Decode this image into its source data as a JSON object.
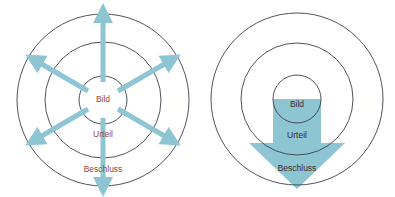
{
  "colors": {
    "arrow": "#8ec5d3",
    "circle_stroke": "#3a3f4a",
    "label_left": "#a0453a",
    "label_right": "#3a2c2a",
    "background": "#ffffff"
  },
  "left_diagram": {
    "name": "Radiating model",
    "labels": {
      "inner": "Bild",
      "middle": "Urteil",
      "outer": "Beschluss"
    },
    "arrow_count": 6,
    "arrow_directions_deg": [
      270,
      330,
      30,
      90,
      150,
      210
    ]
  },
  "right_diagram": {
    "name": "Funnel model",
    "labels": {
      "inner": "Bild",
      "middle": "Urteil",
      "outer": "Beschluss"
    },
    "arrow_direction": "down"
  }
}
